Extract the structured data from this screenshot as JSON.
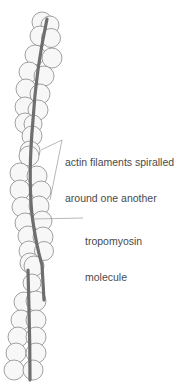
{
  "labels": {
    "actin": {
      "line1": "actin filaments spiralled",
      "line2": "around one another"
    },
    "tropomyosin": {
      "line1": "tropomyosin",
      "line2": "molecule"
    }
  },
  "colors": {
    "circle_stroke": "#8a8a8a",
    "circle_fill": "#f7f7f7",
    "rod": "#6e6e6e",
    "leader": "#9a9a9a",
    "text": "#4a4a4a"
  }
}
